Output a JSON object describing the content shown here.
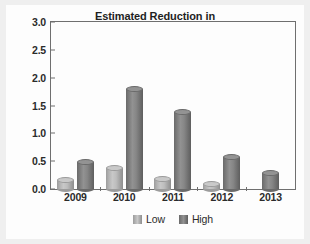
{
  "chart_data": {
    "type": "bar",
    "title": "Estimated Reduction in Unemployment Rate Percentage Points",
    "title_lines": [
      "Estimated Reduction in",
      "Unemployment Rate Percentage Points"
    ],
    "subtitle": "(reduction shown as positive number)",
    "xlabel": "",
    "ylabel": "",
    "categories": [
      "2009",
      "2010",
      "2011",
      "2012",
      "2013"
    ],
    "series": [
      {
        "name": "Low",
        "color": "#c8c8c8",
        "values": [
          0.17,
          0.38,
          0.18,
          0.09,
          null
        ]
      },
      {
        "name": "High",
        "color": "#7d7d7d",
        "values": [
          0.48,
          1.8,
          1.38,
          0.57,
          0.29
        ]
      }
    ],
    "ylim": [
      0.0,
      3.0
    ],
    "ytick_values": [
      0.0,
      0.5,
      1.0,
      1.5,
      2.0,
      2.5,
      3.0
    ],
    "ytick_labels": [
      "0.0",
      "0.5",
      "1.0",
      "1.5",
      "2.0",
      "2.5",
      "3.0"
    ],
    "grid": false,
    "legend_position": "bottom",
    "bar_style": "3d-cylinder"
  },
  "legend": {
    "items": [
      {
        "label": "Low"
      },
      {
        "label": "High"
      }
    ]
  }
}
